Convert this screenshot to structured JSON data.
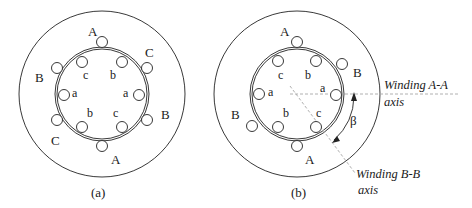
{
  "figure_a": {
    "caption": "(a)",
    "stator_labels": [
      "A",
      "C",
      "B",
      "A",
      "C",
      "B"
    ],
    "rotor_labels": [
      "c",
      "b",
      "a",
      "a",
      "b",
      "c"
    ]
  },
  "figure_b": {
    "caption": "(b)",
    "stator_labels": [
      "A",
      "B",
      "B",
      "A"
    ],
    "rotor_labels": [
      "c",
      "b",
      "a",
      "a",
      "b",
      "c"
    ],
    "angle_label": "β",
    "axis_a_label_line1": "Winding A-A",
    "axis_a_label_line2": "axis",
    "axis_b_label_line1": "Winding B-B",
    "axis_b_label_line2": "axis"
  },
  "colors": {
    "line": "#222222",
    "axis_dash": "#b0b0b0",
    "background": "#ffffff"
  }
}
